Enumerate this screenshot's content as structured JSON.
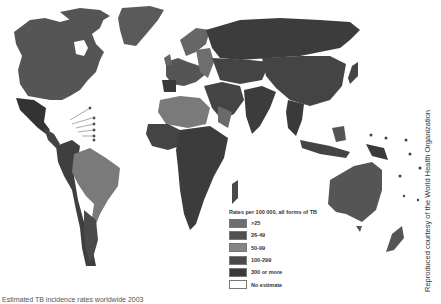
{
  "map": {
    "title": "Estimated TB incidence rates",
    "colors": {
      "lt25": "#6b6b6b",
      "r26_49": "#555555",
      "r50_99": "#7a7a7a",
      "r100_299": "#4d4d4d",
      "r300plus": "#3a3a3a",
      "no_estimate": "#ffffff",
      "ocean": "#ffffff"
    }
  },
  "legend": {
    "title": "Rates per 100 000, all forms of TB",
    "items": [
      {
        "label": ">25",
        "color": "#6e6e6e"
      },
      {
        "label": "26-49",
        "color": "#515151"
      },
      {
        "label": "50-99",
        "color": "#858585"
      },
      {
        "label": "100-299",
        "color": "#4a4a4a"
      },
      {
        "label": "300 or more",
        "color": "#3a3a3a"
      },
      {
        "label": "No estimate",
        "color": "#ffffff"
      }
    ]
  },
  "credit": "Reproduced courtesy of the World Health Organization",
  "caption": "Estimated TB incidence rates worldwide 2003"
}
